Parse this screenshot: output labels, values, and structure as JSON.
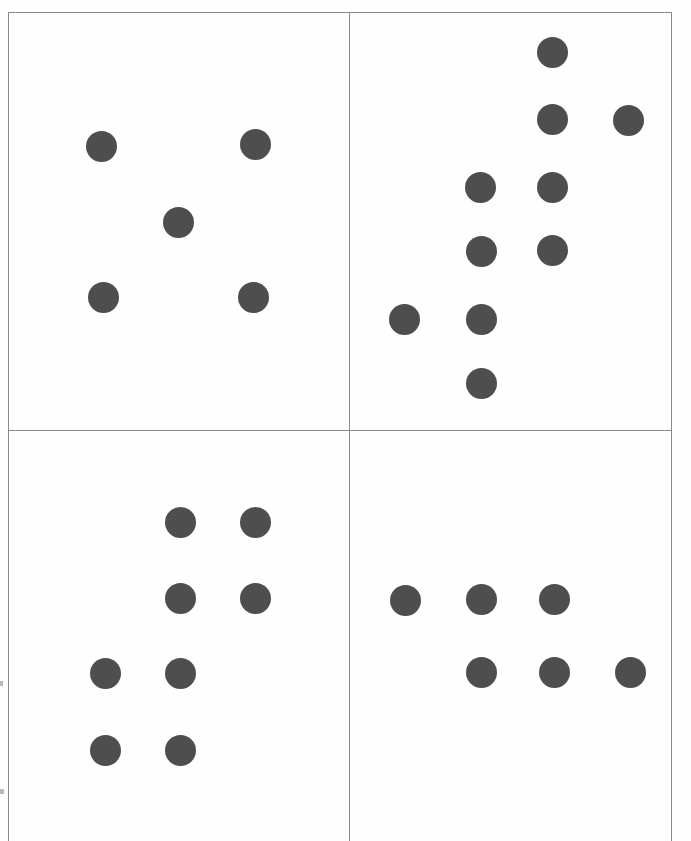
{
  "document": {
    "kind": "scanned-worksheet",
    "title": "Dot Pattern Panels",
    "page_width": 691,
    "page_height": 841,
    "background_color": "#ffffff",
    "rule_color": "#8a8a8a",
    "dot_color": "#4e4e4e",
    "dot_diameter": 31
  },
  "frame": {
    "left": 8,
    "top": 12,
    "right": 671,
    "bottom": 841,
    "divider_x": 349,
    "divider_y": 430
  },
  "panels": [
    {
      "id": "panel-top-left",
      "label": "Top left panel",
      "position": "top-left",
      "x": 8,
      "y": 12,
      "width": 341,
      "height": 418,
      "dot_count": 5,
      "dots": [
        {
          "cx": 101,
          "cy": 146,
          "r": 15.5
        },
        {
          "cx": 255,
          "cy": 144,
          "r": 15.5
        },
        {
          "cx": 178,
          "cy": 222,
          "r": 15.5
        },
        {
          "cx": 103,
          "cy": 297,
          "r": 15.5
        },
        {
          "cx": 253,
          "cy": 297,
          "r": 15.5
        }
      ]
    },
    {
      "id": "panel-top-right",
      "label": "Top right panel",
      "position": "top-right",
      "x": 349,
      "y": 12,
      "width": 322,
      "height": 418,
      "dot_count": 10,
      "dots": [
        {
          "cx": 552,
          "cy": 52,
          "r": 15.5
        },
        {
          "cx": 552,
          "cy": 119,
          "r": 15.5
        },
        {
          "cx": 628,
          "cy": 120,
          "r": 15.5
        },
        {
          "cx": 480,
          "cy": 187,
          "r": 15.5
        },
        {
          "cx": 552,
          "cy": 187,
          "r": 15.5
        },
        {
          "cx": 481,
          "cy": 251,
          "r": 15.5
        },
        {
          "cx": 552,
          "cy": 250,
          "r": 15.5
        },
        {
          "cx": 404,
          "cy": 319,
          "r": 15.5
        },
        {
          "cx": 481,
          "cy": 319,
          "r": 15.5
        },
        {
          "cx": 481,
          "cy": 383,
          "r": 15.5
        }
      ]
    },
    {
      "id": "panel-bottom-left",
      "label": "Bottom left panel",
      "position": "bottom-left",
      "x": 8,
      "y": 430,
      "width": 341,
      "height": 411,
      "dot_count": 8,
      "dots": [
        {
          "cx": 180,
          "cy": 522,
          "r": 15.5
        },
        {
          "cx": 255,
          "cy": 522,
          "r": 15.5
        },
        {
          "cx": 180,
          "cy": 598,
          "r": 15.5
        },
        {
          "cx": 255,
          "cy": 598,
          "r": 15.5
        },
        {
          "cx": 105,
          "cy": 673,
          "r": 15.5
        },
        {
          "cx": 180,
          "cy": 673,
          "r": 15.5
        },
        {
          "cx": 105,
          "cy": 750,
          "r": 15.5
        },
        {
          "cx": 180,
          "cy": 750,
          "r": 15.5
        }
      ]
    },
    {
      "id": "panel-bottom-right",
      "label": "Bottom right panel",
      "position": "bottom-right",
      "x": 349,
      "y": 430,
      "width": 322,
      "height": 411,
      "dot_count": 6,
      "dots": [
        {
          "cx": 405,
          "cy": 600,
          "r": 15.5
        },
        {
          "cx": 481,
          "cy": 599,
          "r": 15.5
        },
        {
          "cx": 554,
          "cy": 599,
          "r": 15.5
        },
        {
          "cx": 481,
          "cy": 672,
          "r": 15.5
        },
        {
          "cx": 554,
          "cy": 672,
          "r": 15.5
        },
        {
          "cx": 630,
          "cy": 672,
          "r": 15.5
        }
      ]
    }
  ],
  "rules": [
    {
      "id": "frame-top",
      "name": "frame-top-rule",
      "orient": "h",
      "x": 8,
      "y": 12,
      "length": 663
    },
    {
      "id": "frame-left",
      "name": "frame-left-rule",
      "orient": "v",
      "x": 8,
      "y": 12,
      "length": 829
    },
    {
      "id": "frame-right",
      "name": "frame-right-rule",
      "orient": "v",
      "x": 671,
      "y": 12,
      "length": 829
    },
    {
      "id": "divider-horiz",
      "name": "divider-horizontal",
      "orient": "h",
      "x": 8,
      "y": 430,
      "length": 663
    },
    {
      "id": "divider-vert",
      "name": "divider-vertical",
      "orient": "v",
      "x": 349,
      "y": 12,
      "length": 829
    }
  ],
  "speckles": [
    {
      "x": 0,
      "y": 681,
      "w": 3,
      "h": 5
    },
    {
      "x": 0,
      "y": 789,
      "w": 4,
      "h": 5
    }
  ],
  "chart_data": {
    "type": "scatter",
    "xlabel": "",
    "ylabel": "",
    "grid": false,
    "legend": "none",
    "xlim": [
      8,
      671
    ],
    "ylim": [
      12,
      841
    ],
    "note": "Four-quadrant sheet; each quadrant shows a cluster of uniform dark-gray dots.",
    "series": [
      {
        "name": "Top left panel",
        "count": 5,
        "x": [
          101,
          255,
          178,
          103,
          253
        ],
        "y": [
          146,
          144,
          222,
          297,
          297
        ]
      },
      {
        "name": "Top right panel",
        "count": 10,
        "x": [
          552,
          552,
          628,
          480,
          552,
          481,
          552,
          404,
          481,
          481
        ],
        "y": [
          52,
          119,
          120,
          187,
          187,
          251,
          250,
          319,
          319,
          383
        ]
      },
      {
        "name": "Bottom left panel",
        "count": 8,
        "x": [
          180,
          255,
          180,
          255,
          105,
          180,
          105,
          180
        ],
        "y": [
          522,
          522,
          598,
          598,
          673,
          673,
          750,
          750
        ]
      },
      {
        "name": "Bottom right panel",
        "count": 6,
        "x": [
          405,
          481,
          554,
          481,
          554,
          630
        ],
        "y": [
          600,
          599,
          599,
          672,
          672,
          672
        ]
      }
    ],
    "categories": [
      "Top left panel",
      "Top right panel",
      "Bottom left panel",
      "Bottom right panel"
    ],
    "values": [
      5,
      10,
      8,
      6
    ]
  }
}
